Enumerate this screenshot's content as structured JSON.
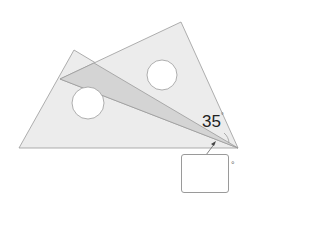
{
  "diagram": {
    "colors": {
      "triangle_fill": "#ececec",
      "overlap_fill": "#d4d4d4",
      "stroke": "#9a9a9a",
      "hole_fill": "#ffffff"
    },
    "triangles": [
      {
        "name": "set-square-b",
        "points": [
          [
            74,
            50
          ],
          [
            19,
            148
          ],
          [
            238,
            148
          ]
        ]
      },
      {
        "name": "set-square-a",
        "points": [
          [
            181,
            22
          ],
          [
            60,
            79
          ],
          [
            238,
            148
          ]
        ]
      }
    ],
    "overlap": {
      "points": [
        [
          60,
          79
        ],
        [
          94,
          63
        ],
        [
          238,
          148
        ]
      ]
    },
    "holes": [
      {
        "name": "hole-left",
        "cx": 88,
        "cy": 103,
        "r": 16
      },
      {
        "name": "hole-right",
        "cx": 162,
        "cy": 75,
        "r": 15
      }
    ],
    "angle_label": {
      "value": "35",
      "unit": "°"
    },
    "answer_box": {
      "value": "",
      "unit": "°"
    }
  }
}
